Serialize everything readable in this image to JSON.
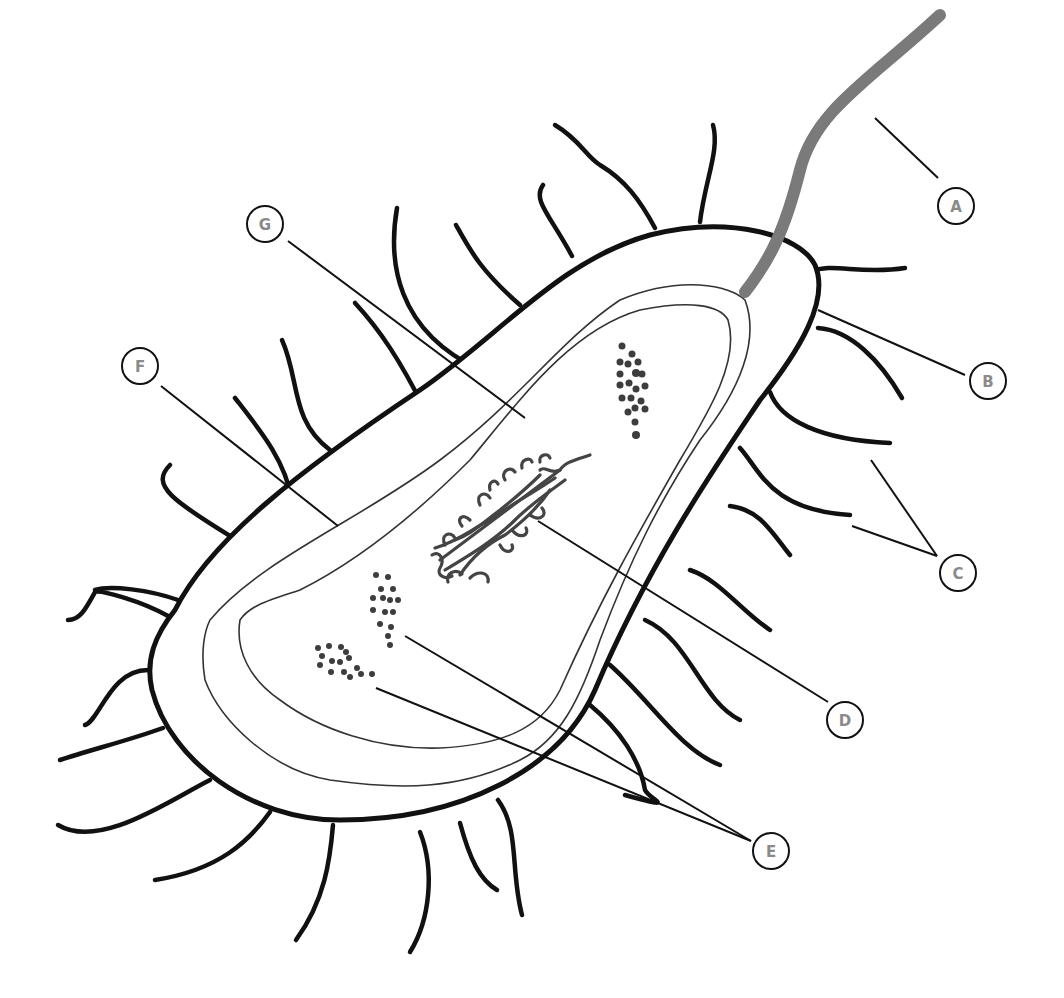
{
  "diagram": {
    "colors": {
      "outline": "#111111",
      "flagellum": "#7a7a7a",
      "label_text": "#8a8a8a",
      "background": "#ffffff"
    },
    "labels": {
      "A": {
        "text": "A",
        "points_to": "flagellum"
      },
      "B": {
        "text": "B",
        "points_to": "cell wall / capsule"
      },
      "C": {
        "text": "C",
        "points_to": "pili"
      },
      "D": {
        "text": "D",
        "points_to": "nucleoid (DNA)"
      },
      "E": {
        "text": "E",
        "points_to": "ribosomes"
      },
      "F": {
        "text": "F",
        "points_to": "cell membrane"
      },
      "G": {
        "text": "G",
        "points_to": "cytoplasm"
      }
    }
  }
}
